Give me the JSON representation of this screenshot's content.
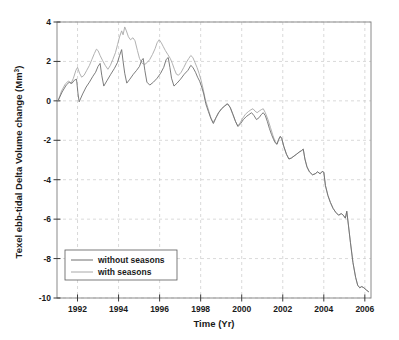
{
  "chart_data": {
    "type": "line",
    "title": "",
    "xlabel": "Time (Yr)",
    "ylabel": "Texel ebb-tidal Delta Volume change (Mm",
    "ylabel_sup": "3",
    "ylabel_close": ")",
    "xlim": [
      1991,
      2006.3
    ],
    "ylim": [
      -10,
      4
    ],
    "xticks": [
      1992,
      1994,
      1996,
      1998,
      2000,
      2002,
      2004,
      2006
    ],
    "xtick_labels": [
      "1992",
      "1994",
      "1996",
      "1998",
      "2000",
      "2002",
      "2004",
      "2006"
    ],
    "yticks": [
      4,
      2,
      0,
      -2,
      -4,
      -6,
      -8,
      -10
    ],
    "ytick_labels": [
      "4",
      "2",
      "0",
      "-2",
      "-4",
      "-6",
      "-8",
      "-10"
    ],
    "grid": true,
    "grid_style": "dashed",
    "grid_color": "#c8c8c8",
    "axis_color": "#8a8a8a",
    "legend_position": "bottom-left",
    "series": [
      {
        "name": "without seasons",
        "label": "without seasons",
        "color": "#6e6e6e",
        "width": 0.9,
        "points": [
          [
            1991.05,
            0.0
          ],
          [
            1991.25,
            0.45
          ],
          [
            1991.45,
            0.8
          ],
          [
            1991.6,
            0.95
          ],
          [
            1991.72,
            0.88
          ],
          [
            1991.85,
            1.05
          ],
          [
            1991.95,
            1.1
          ],
          [
            1992.02,
            0.4
          ],
          [
            1992.08,
            -0.05
          ],
          [
            1992.25,
            0.35
          ],
          [
            1992.42,
            0.7
          ],
          [
            1992.58,
            0.95
          ],
          [
            1992.75,
            1.25
          ],
          [
            1992.88,
            1.45
          ],
          [
            1993.0,
            1.75
          ],
          [
            1993.1,
            1.9
          ],
          [
            1993.18,
            1.3
          ],
          [
            1993.28,
            0.75
          ],
          [
            1993.45,
            1.05
          ],
          [
            1993.62,
            1.35
          ],
          [
            1993.8,
            1.65
          ],
          [
            1993.95,
            1.95
          ],
          [
            1994.05,
            2.3
          ],
          [
            1994.15,
            2.6
          ],
          [
            1994.22,
            2.0
          ],
          [
            1994.3,
            1.4
          ],
          [
            1994.4,
            0.9
          ],
          [
            1994.55,
            1.1
          ],
          [
            1994.72,
            1.35
          ],
          [
            1994.88,
            1.55
          ],
          [
            1995.02,
            1.75
          ],
          [
            1995.12,
            2.05
          ],
          [
            1995.2,
            2.15
          ],
          [
            1995.28,
            1.55
          ],
          [
            1995.38,
            0.95
          ],
          [
            1995.52,
            0.8
          ],
          [
            1995.7,
            0.95
          ],
          [
            1995.88,
            1.15
          ],
          [
            1996.05,
            1.4
          ],
          [
            1996.2,
            1.7
          ],
          [
            1996.32,
            2.1
          ],
          [
            1996.42,
            2.2
          ],
          [
            1996.5,
            1.7
          ],
          [
            1996.58,
            1.15
          ],
          [
            1996.7,
            0.75
          ],
          [
            1996.85,
            0.9
          ],
          [
            1997.02,
            1.1
          ],
          [
            1997.2,
            1.35
          ],
          [
            1997.38,
            1.55
          ],
          [
            1997.52,
            1.8
          ],
          [
            1997.62,
            1.7
          ],
          [
            1997.75,
            1.45
          ],
          [
            1997.85,
            1.2
          ],
          [
            1997.95,
            1.0
          ],
          [
            1998.05,
            0.7
          ],
          [
            1998.15,
            0.35
          ],
          [
            1998.25,
            -0.15
          ],
          [
            1998.38,
            -0.55
          ],
          [
            1998.5,
            -0.9
          ],
          [
            1998.62,
            -1.15
          ],
          [
            1998.75,
            -0.85
          ],
          [
            1998.88,
            -0.6
          ],
          [
            1999.02,
            -0.4
          ],
          [
            1999.18,
            -0.25
          ],
          [
            1999.32,
            -0.15
          ],
          [
            1999.45,
            -0.35
          ],
          [
            1999.58,
            -0.7
          ],
          [
            1999.7,
            -1.05
          ],
          [
            1999.82,
            -1.3
          ],
          [
            1999.95,
            -1.15
          ],
          [
            2000.08,
            -0.95
          ],
          [
            2000.22,
            -0.8
          ],
          [
            2000.35,
            -0.7
          ],
          [
            2000.48,
            -0.6
          ],
          [
            2000.6,
            -0.75
          ],
          [
            2000.72,
            -0.95
          ],
          [
            2000.85,
            -0.85
          ],
          [
            2000.95,
            -0.7
          ],
          [
            2001.05,
            -0.6
          ],
          [
            2001.15,
            -0.75
          ],
          [
            2001.25,
            -1.05
          ],
          [
            2001.35,
            -1.4
          ],
          [
            2001.45,
            -1.7
          ],
          [
            2001.55,
            -1.95
          ],
          [
            2001.65,
            -2.15
          ],
          [
            2001.72,
            -2.2
          ],
          [
            2001.8,
            -1.95
          ],
          [
            2001.88,
            -1.8
          ],
          [
            2001.95,
            -1.9
          ],
          [
            2002.05,
            -2.3
          ],
          [
            2002.18,
            -2.7
          ],
          [
            2002.3,
            -2.95
          ],
          [
            2002.42,
            -2.9
          ],
          [
            2002.55,
            -2.8
          ],
          [
            2002.68,
            -2.7
          ],
          [
            2002.8,
            -2.6
          ],
          [
            2002.92,
            -2.52
          ],
          [
            2003.0,
            -2.45
          ],
          [
            2003.08,
            -2.95
          ],
          [
            2003.18,
            -3.35
          ],
          [
            2003.3,
            -3.6
          ],
          [
            2003.45,
            -3.75
          ],
          [
            2003.58,
            -3.7
          ],
          [
            2003.7,
            -3.6
          ],
          [
            2003.82,
            -3.7
          ],
          [
            2003.92,
            -3.58
          ],
          [
            2004.0,
            -3.62
          ],
          [
            2004.08,
            -4.3
          ],
          [
            2004.2,
            -4.8
          ],
          [
            2004.32,
            -5.15
          ],
          [
            2004.45,
            -5.45
          ],
          [
            2004.58,
            -5.65
          ],
          [
            2004.72,
            -5.8
          ],
          [
            2004.85,
            -5.72
          ],
          [
            2004.95,
            -5.8
          ],
          [
            2005.05,
            -5.95
          ],
          [
            2005.12,
            -5.6
          ],
          [
            2005.2,
            -6.3
          ],
          [
            2005.3,
            -7.2
          ],
          [
            2005.42,
            -8.2
          ],
          [
            2005.55,
            -8.95
          ],
          [
            2005.65,
            -9.35
          ],
          [
            2005.75,
            -9.48
          ],
          [
            2005.85,
            -9.42
          ],
          [
            2005.95,
            -9.48
          ],
          [
            2006.08,
            -9.6
          ],
          [
            2006.18,
            -9.68
          ]
        ]
      },
      {
        "name": "with seasons",
        "label": "with seasons",
        "color": "#a8a8a8",
        "width": 0.9,
        "points": [
          [
            1991.05,
            0.0
          ],
          [
            1991.22,
            0.5
          ],
          [
            1991.4,
            0.85
          ],
          [
            1991.55,
            1.0
          ],
          [
            1991.68,
            0.88
          ],
          [
            1991.8,
            1.15
          ],
          [
            1991.92,
            1.55
          ],
          [
            1992.0,
            1.7
          ],
          [
            1992.1,
            1.4
          ],
          [
            1992.2,
            1.2
          ],
          [
            1992.32,
            1.3
          ],
          [
            1992.45,
            1.55
          ],
          [
            1992.58,
            1.8
          ],
          [
            1992.7,
            2.1
          ],
          [
            1992.82,
            2.4
          ],
          [
            1992.92,
            2.62
          ],
          [
            1993.0,
            2.55
          ],
          [
            1993.1,
            2.3
          ],
          [
            1993.22,
            2.05
          ],
          [
            1993.35,
            1.8
          ],
          [
            1993.48,
            1.6
          ],
          [
            1993.6,
            1.8
          ],
          [
            1993.72,
            2.1
          ],
          [
            1993.85,
            2.45
          ],
          [
            1993.95,
            2.85
          ],
          [
            1994.05,
            3.25
          ],
          [
            1994.15,
            3.55
          ],
          [
            1994.22,
            3.35
          ],
          [
            1994.3,
            3.75
          ],
          [
            1994.38,
            3.55
          ],
          [
            1994.48,
            3.25
          ],
          [
            1994.58,
            3.1
          ],
          [
            1994.7,
            3.2
          ],
          [
            1994.8,
            3.05
          ],
          [
            1994.92,
            2.55
          ],
          [
            1995.02,
            2.15
          ],
          [
            1995.15,
            1.9
          ],
          [
            1995.28,
            1.85
          ],
          [
            1995.4,
            1.95
          ],
          [
            1995.52,
            2.1
          ],
          [
            1995.65,
            2.35
          ],
          [
            1995.78,
            2.65
          ],
          [
            1995.88,
            2.95
          ],
          [
            1995.98,
            3.1
          ],
          [
            1996.08,
            2.95
          ],
          [
            1996.18,
            2.75
          ],
          [
            1996.28,
            2.55
          ],
          [
            1996.4,
            2.35
          ],
          [
            1996.52,
            2.15
          ],
          [
            1996.62,
            1.9
          ],
          [
            1996.72,
            1.6
          ],
          [
            1996.82,
            1.35
          ],
          [
            1996.92,
            1.3
          ],
          [
            1997.05,
            1.45
          ],
          [
            1997.18,
            1.7
          ],
          [
            1997.3,
            1.95
          ],
          [
            1997.42,
            2.15
          ],
          [
            1997.52,
            2.3
          ],
          [
            1997.62,
            2.2
          ],
          [
            1997.72,
            1.95
          ],
          [
            1997.82,
            1.7
          ],
          [
            1997.92,
            1.4
          ],
          [
            1998.02,
            1.05
          ],
          [
            1998.12,
            0.6
          ],
          [
            1998.22,
            0.1
          ],
          [
            1998.35,
            -0.35
          ],
          [
            1998.48,
            -0.8
          ],
          [
            1998.6,
            -1.1
          ],
          [
            1998.72,
            -0.9
          ],
          [
            1998.85,
            -0.62
          ],
          [
            1999.0,
            -0.42
          ],
          [
            1999.15,
            -0.28
          ],
          [
            1999.28,
            -0.15
          ],
          [
            1999.42,
            -0.3
          ],
          [
            1999.55,
            -0.65
          ],
          [
            1999.68,
            -1.0
          ],
          [
            1999.8,
            -1.28
          ],
          [
            1999.92,
            -1.12
          ],
          [
            2000.05,
            -0.88
          ],
          [
            2000.18,
            -0.68
          ],
          [
            2000.32,
            -0.55
          ],
          [
            2000.45,
            -0.45
          ],
          [
            2000.55,
            -0.4
          ],
          [
            2000.65,
            -0.52
          ],
          [
            2000.75,
            -0.6
          ],
          [
            2000.85,
            -0.52
          ],
          [
            2000.95,
            -0.45
          ],
          [
            2001.05,
            -0.4
          ],
          [
            2001.15,
            -0.6
          ],
          [
            2001.28,
            -0.95
          ],
          [
            2001.4,
            -1.35
          ],
          [
            2001.52,
            -1.75
          ],
          [
            2001.62,
            -2.05
          ],
          [
            2001.72,
            -2.2
          ],
          [
            2001.8,
            -1.98
          ],
          [
            2001.88,
            -1.82
          ],
          [
            2001.95,
            -1.92
          ],
          [
            2002.05,
            -2.32
          ],
          [
            2002.18,
            -2.72
          ],
          [
            2002.3,
            -2.95
          ],
          [
            2002.42,
            -2.9
          ],
          [
            2002.55,
            -2.8
          ],
          [
            2002.68,
            -2.7
          ],
          [
            2002.8,
            -2.6
          ],
          [
            2002.92,
            -2.52
          ],
          [
            2003.0,
            -2.45
          ],
          [
            2003.08,
            -2.95
          ],
          [
            2003.18,
            -3.35
          ],
          [
            2003.3,
            -3.6
          ],
          [
            2003.45,
            -3.75
          ],
          [
            2003.58,
            -3.7
          ],
          [
            2003.7,
            -3.6
          ],
          [
            2003.82,
            -3.7
          ],
          [
            2003.92,
            -3.58
          ],
          [
            2004.0,
            -3.62
          ],
          [
            2004.08,
            -4.3
          ],
          [
            2004.2,
            -4.8
          ],
          [
            2004.32,
            -5.15
          ],
          [
            2004.45,
            -5.45
          ],
          [
            2004.58,
            -5.65
          ],
          [
            2004.72,
            -5.8
          ],
          [
            2004.85,
            -5.72
          ],
          [
            2004.95,
            -5.8
          ],
          [
            2005.05,
            -5.95
          ],
          [
            2005.12,
            -5.6
          ],
          [
            2005.2,
            -6.3
          ],
          [
            2005.3,
            -7.2
          ],
          [
            2005.42,
            -8.2
          ],
          [
            2005.55,
            -8.95
          ],
          [
            2005.65,
            -9.35
          ],
          [
            2005.75,
            -9.48
          ],
          [
            2005.85,
            -9.42
          ],
          [
            2005.95,
            -9.48
          ],
          [
            2006.08,
            -9.6
          ],
          [
            2006.18,
            -9.68
          ]
        ]
      }
    ]
  },
  "legend": {
    "items": [
      {
        "label": "without seasons"
      },
      {
        "label": "with seasons"
      }
    ]
  }
}
